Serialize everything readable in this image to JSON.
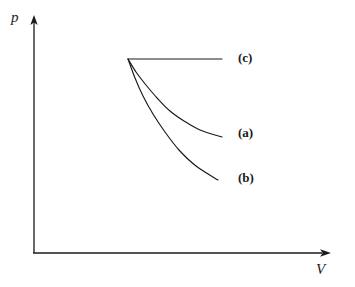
{
  "figure": {
    "background_color": "#ffffff",
    "line_color": "#1a1a1a"
  },
  "axes": {
    "y_label": "p",
    "x_label": "V",
    "y_label_name": "pressure",
    "x_label_name": "volume",
    "origin": [
      33,
      253
    ],
    "y_axis_top": 16,
    "x_axis_right": 330,
    "arrowheads": true,
    "ticks": [],
    "tick_labels": [],
    "gridlines": false
  },
  "curve_labels": {
    "c": "(c)",
    "a": "(a)",
    "b": "(b)"
  },
  "chart_data": {
    "type": "line",
    "title": "",
    "xlabel": "V",
    "ylabel": "p",
    "xlim": [
      33,
      330
    ],
    "ylim": [
      253,
      16
    ],
    "grid": false,
    "legend": "inline-right-labels",
    "axis_ticks": "none",
    "common_start_point": [
      128,
      59
    ],
    "series": [
      {
        "name": "(c)",
        "label": "(c)",
        "description": "isobaric - horizontal line, constant pressure",
        "label_position": [
          238,
          51
        ],
        "points": [
          [
            128,
            59
          ],
          [
            152,
            59
          ],
          [
            176,
            59
          ],
          [
            200,
            59
          ],
          [
            222,
            59
          ]
        ]
      },
      {
        "name": "(a)",
        "label": "(a)",
        "description": "isothermal - convex decreasing curve",
        "label_position": [
          238,
          126
        ],
        "points": [
          [
            128,
            59
          ],
          [
            136,
            72
          ],
          [
            146,
            85
          ],
          [
            158,
            99
          ],
          [
            170,
            111
          ],
          [
            184,
            121
          ],
          [
            200,
            130
          ],
          [
            222,
            137
          ]
        ]
      },
      {
        "name": "(b)",
        "label": "(b)",
        "description": "adiabatic - steeper convex decreasing curve",
        "label_position": [
          238,
          171
        ],
        "points": [
          [
            128,
            59
          ],
          [
            135,
            78
          ],
          [
            143,
            96
          ],
          [
            153,
            114
          ],
          [
            165,
            132
          ],
          [
            179,
            150
          ],
          [
            196,
            166
          ],
          [
            218,
            180
          ]
        ]
      }
    ]
  }
}
